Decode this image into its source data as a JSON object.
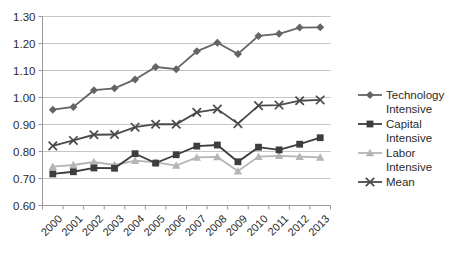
{
  "chart_data": {
    "type": "line",
    "title": "",
    "subtitle": "",
    "xlabel": "",
    "ylabel": "",
    "categories": [
      "2000",
      "2001",
      "2002",
      "2003",
      "2004",
      "2005",
      "2006",
      "2007",
      "2008",
      "2009",
      "2010",
      "2011",
      "2012",
      "2013"
    ],
    "ylim": [
      0.6,
      1.3
    ],
    "ytick_labels": [
      "1.30",
      "1.20",
      "1.10",
      "1.00",
      "0.90",
      "0.80",
      "0.70",
      "0.60"
    ],
    "ytick_values": [
      1.3,
      1.2,
      1.1,
      1.0,
      0.9,
      0.8,
      0.7,
      0.6
    ],
    "grid": true,
    "legend_position": "right",
    "series": [
      {
        "name": "Technology Intensive",
        "legend_label_line1": "Technology",
        "legend_label_line2": "Intensive",
        "marker": "diamond",
        "color": "#646464",
        "values": [
          0.955,
          0.965,
          1.027,
          1.034,
          1.067,
          1.113,
          1.105,
          1.171,
          1.203,
          1.161,
          1.228,
          1.236,
          1.259,
          1.26
        ]
      },
      {
        "name": "Capital Intensive",
        "legend_label_line1": "Capital",
        "legend_label_line2": "Intensive",
        "marker": "square",
        "color": "#3d3d3d",
        "values": [
          0.717,
          0.725,
          0.739,
          0.738,
          0.792,
          0.757,
          0.788,
          0.82,
          0.824,
          0.762,
          0.816,
          0.806,
          0.827,
          0.851
        ]
      },
      {
        "name": "Labor Intensive",
        "legend_label_line1": "Labor",
        "legend_label_line2": "Intensive",
        "marker": "triangle",
        "color": "#b5b5b5",
        "values": [
          0.744,
          0.75,
          0.761,
          0.75,
          0.766,
          0.76,
          0.748,
          0.778,
          0.78,
          0.727,
          0.781,
          0.784,
          0.781,
          0.778
        ]
      },
      {
        "name": "Mean",
        "legend_label_line1": "Mean",
        "legend_label_line2": "",
        "marker": "x",
        "color": "#4a4a4a",
        "values": [
          0.821,
          0.841,
          0.862,
          0.863,
          0.89,
          0.901,
          0.901,
          0.945,
          0.957,
          0.903,
          0.97,
          0.972,
          0.988,
          0.991
        ]
      }
    ]
  }
}
